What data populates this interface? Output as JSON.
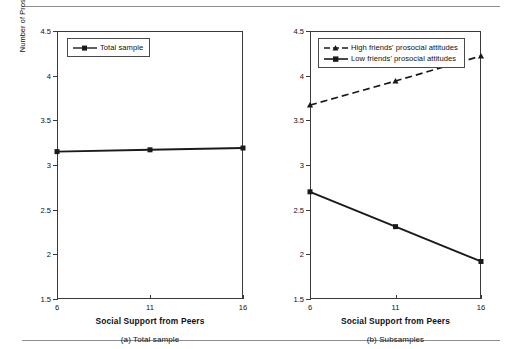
{
  "figure": {
    "ylabel": "Number of Prosocial Choices in Problem Situations",
    "xlabel": "Social Support from Peers",
    "ytick_labels": [
      "4.5",
      "4",
      "3.5",
      "3",
      "2.5",
      "2",
      "1.5"
    ],
    "xtick_labels": [
      "6",
      "11",
      "16"
    ]
  },
  "panel_a": {
    "caption": "(a) Total sample",
    "xlabel": "Social Support from Peers",
    "legend": [
      {
        "label": "Total sample",
        "style": "solid",
        "marker": "square"
      }
    ]
  },
  "panel_b": {
    "caption": "(b) Subsamples",
    "xlabel": "Social Support from Peers",
    "legend": [
      {
        "label": "High friends' prosocial attitudes",
        "style": "dashed",
        "marker": "triangle"
      },
      {
        "label": "Low friends' prosocial attitudes",
        "style": "solid",
        "marker": "square"
      }
    ]
  },
  "chart_data": [
    {
      "type": "line",
      "title": "(a) Total sample",
      "xlabel": "Social Support from Peers",
      "ylabel": "Number of Prosocial Choices in Problem Situations",
      "x": [
        6,
        11,
        16
      ],
      "xlim": [
        6,
        16
      ],
      "ylim": [
        1.5,
        4.5
      ],
      "yticks": [
        1.5,
        2,
        2.5,
        3,
        3.5,
        4,
        4.5
      ],
      "xticks": [
        6,
        11,
        16
      ],
      "grid": false,
      "legend_position": "top-left",
      "series": [
        {
          "name": "Total sample",
          "values": [
            3.15,
            3.17,
            3.19
          ],
          "style": "solid",
          "marker": "square",
          "color": "#1a1a1a"
        }
      ]
    },
    {
      "type": "line",
      "title": "(b) Subsamples",
      "xlabel": "Social Support from Peers",
      "ylabel": "Number of Prosocial Choices in Problem Situations",
      "x": [
        6,
        11,
        16
      ],
      "xlim": [
        6,
        16
      ],
      "ylim": [
        1.5,
        4.5
      ],
      "yticks": [
        1.5,
        2,
        2.5,
        3,
        3.5,
        4,
        4.5
      ],
      "xticks": [
        6,
        11,
        16
      ],
      "grid": false,
      "legend_position": "top-left",
      "series": [
        {
          "name": "High friends' prosocial attitudes",
          "values": [
            3.67,
            3.94,
            4.22
          ],
          "style": "dashed",
          "marker": "triangle",
          "color": "#1a1a1a"
        },
        {
          "name": "Low friends' prosocial attitudes",
          "values": [
            2.7,
            2.31,
            1.92
          ],
          "style": "solid",
          "marker": "square",
          "color": "#1a1a1a"
        }
      ]
    }
  ]
}
